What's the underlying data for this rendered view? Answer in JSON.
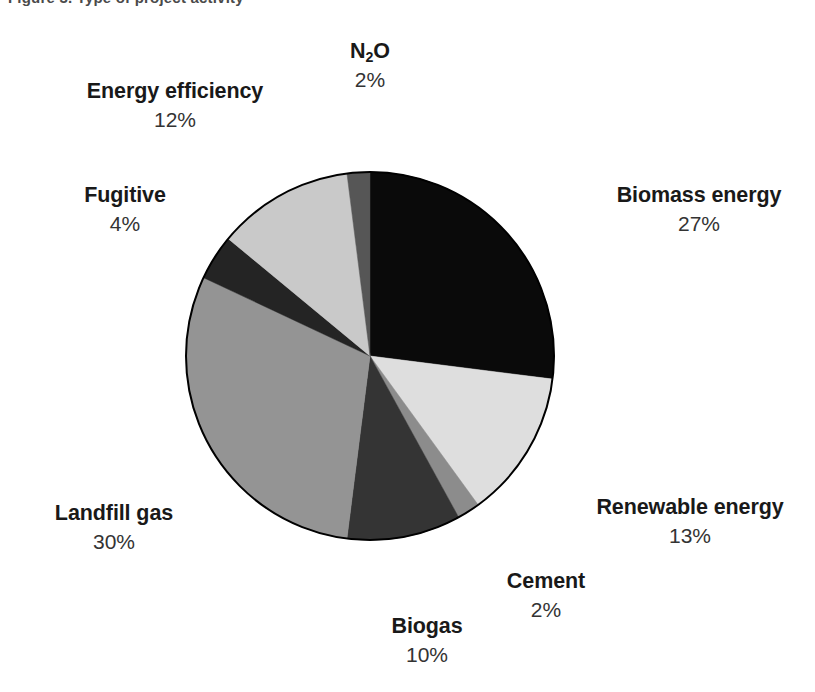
{
  "caption": {
    "text": "Figure 3. Type of project activity"
  },
  "chart_data": {
    "type": "pie",
    "title": "",
    "subtitle": "",
    "xlabel": "",
    "ylabel": "",
    "grid": false,
    "legend_position": "none",
    "label_format": "name above, percent below, placed outside each slice",
    "start_angle_deg": 0,
    "direction": "clockwise",
    "units": "percent",
    "total": 100,
    "categories": [
      "Biomass energy",
      "Renewable energy",
      "Cement",
      "Biogas",
      "Landfill gas",
      "Fugitive",
      "Energy efficiency",
      "N2O"
    ],
    "values": [
      27,
      13,
      2,
      10,
      30,
      4,
      12,
      2
    ],
    "colors": [
      "#0a0a0a",
      "#dedede",
      "#8c8c8c",
      "#343434",
      "#949494",
      "#242424",
      "#c9c9c9",
      "#565656"
    ],
    "slices": [
      {
        "name": "Biomass energy",
        "name_display": "Biomass energy",
        "value": 27,
        "percent_label": "27%",
        "color": "#0a0a0a",
        "start_deg": 0,
        "end_deg": 97.2
      },
      {
        "name": "Renewable energy",
        "name_display": "Renewable energy",
        "value": 13,
        "percent_label": "13%",
        "color": "#dedede",
        "start_deg": 97.2,
        "end_deg": 144.0
      },
      {
        "name": "Cement",
        "name_display": "Cement",
        "value": 2,
        "percent_label": "2%",
        "color": "#8c8c8c",
        "start_deg": 144.0,
        "end_deg": 151.2
      },
      {
        "name": "Biogas",
        "name_display": "Biogas",
        "value": 10,
        "percent_label": "10%",
        "color": "#343434",
        "start_deg": 151.2,
        "end_deg": 187.2
      },
      {
        "name": "Landfill gas",
        "name_display": "Landfill gas",
        "value": 30,
        "percent_label": "30%",
        "color": "#949494",
        "start_deg": 187.2,
        "end_deg": 295.2
      },
      {
        "name": "Fugitive",
        "name_display": "Fugitive",
        "value": 4,
        "percent_label": "4%",
        "color": "#242424",
        "start_deg": 295.2,
        "end_deg": 309.6
      },
      {
        "name": "Energy efficiency",
        "name_display": "Energy efficiency",
        "value": 12,
        "percent_label": "12%",
        "color": "#c9c9c9",
        "start_deg": 309.6,
        "end_deg": 352.8
      },
      {
        "name": "N2O",
        "name_display": "N₂O",
        "value": 2,
        "percent_label": "2%",
        "color": "#565656",
        "start_deg": 352.8,
        "end_deg": 360.0
      }
    ],
    "geometry": {
      "center_x": 370,
      "center_y": 356,
      "radius": 184,
      "outline_color": "#000000"
    }
  },
  "labels": {
    "biomass": {
      "name": "Biomass energy",
      "value": "27%"
    },
    "renewable": {
      "name": "Renewable energy",
      "value": "13%"
    },
    "cement": {
      "name": "Cement",
      "value": "2%"
    },
    "biogas": {
      "name": "Biogas",
      "value": "10%"
    },
    "landfill": {
      "name": "Landfill gas",
      "value": "30%"
    },
    "fugitive": {
      "name": "Fugitive",
      "value": "4%"
    },
    "energy_efficiency": {
      "name": "Energy efficiency",
      "value": "12%"
    },
    "n2o": {
      "name_prefix": "N",
      "name_sub": "2",
      "name_suffix": "O",
      "value": "2%"
    }
  }
}
